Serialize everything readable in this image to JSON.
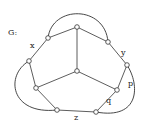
{
  "graph": {
    "title": "G:",
    "nodes": [
      {
        "id": "top",
        "x": 77,
        "y": 27
      },
      {
        "id": "ul",
        "x": 48,
        "y": 38
      },
      {
        "id": "ur",
        "x": 108,
        "y": 42
      },
      {
        "id": "l",
        "x": 29,
        "y": 61
      },
      {
        "id": "rt",
        "x": 127,
        "y": 65
      },
      {
        "id": "c",
        "x": 77,
        "y": 71
      },
      {
        "id": "ll",
        "x": 36,
        "y": 88
      },
      {
        "id": "rl",
        "x": 117,
        "y": 90
      },
      {
        "id": "bl",
        "x": 57,
        "y": 110
      },
      {
        "id": "br",
        "x": 96,
        "y": 112
      }
    ],
    "edges": [
      [
        "top",
        "ul"
      ],
      [
        "top",
        "ur"
      ],
      [
        "top",
        "c"
      ],
      [
        "ul",
        "l"
      ],
      [
        "ur",
        "rt"
      ],
      [
        "l",
        "ll"
      ],
      [
        "rt",
        "rl"
      ],
      [
        "c",
        "ll"
      ],
      [
        "c",
        "rl"
      ],
      [
        "ll",
        "bl"
      ],
      [
        "rl",
        "br"
      ],
      [
        "bl",
        "br"
      ]
    ],
    "curved_edges": [
      {
        "from": "ul",
        "to": "ur",
        "path": "M48,38 C52,5 105,5 108,42"
      },
      {
        "from": "l",
        "to": "bl",
        "path": "M29,61 C5,75 10,115 57,110"
      },
      {
        "from": "rt",
        "to": "br",
        "path": "M127,65 C140,85 140,120 96,112"
      }
    ],
    "labels": [
      {
        "text": "G:",
        "x": 8,
        "y": 29
      },
      {
        "text": "x",
        "x": 30,
        "y": 42
      },
      {
        "text": "y",
        "x": 121,
        "y": 49
      },
      {
        "text": "p",
        "x": 128,
        "y": 80
      },
      {
        "text": "q",
        "x": 106,
        "y": 97
      },
      {
        "text": "z",
        "x": 74,
        "y": 114
      }
    ],
    "colors": {
      "stroke": "#333333",
      "node_fill": "#ffffff"
    }
  }
}
